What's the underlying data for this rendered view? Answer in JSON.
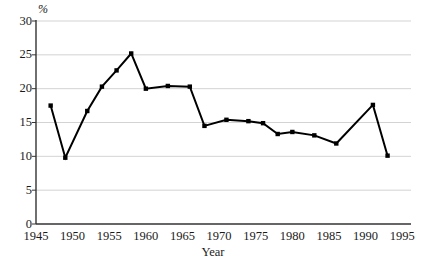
{
  "figure": {
    "y_axis_title": "%",
    "x_axis_title": "Year",
    "caption": ""
  },
  "chart_data": {
    "type": "line",
    "title": "",
    "xlabel": "Year",
    "ylabel": "%",
    "xlim": [
      1945,
      1996
    ],
    "ylim": [
      0,
      30
    ],
    "grid": true,
    "legend": "none",
    "marker": "square",
    "line_color": "#000000",
    "marker_color": "#000000",
    "grid_color": "#c8c8c8",
    "axis_color": "#333333",
    "xticks": [
      1945,
      1950,
      1955,
      1960,
      1965,
      1970,
      1975,
      1980,
      1985,
      1990,
      1995
    ],
    "yticks": [
      0,
      5,
      10,
      15,
      20,
      25,
      30
    ],
    "x": [
      1947,
      1949,
      1952,
      1954,
      1956,
      1958,
      1960,
      1963,
      1966,
      1968,
      1971,
      1974,
      1976,
      1978,
      1980,
      1983,
      1986,
      1991,
      1993
    ],
    "values": [
      17.5,
      9.8,
      16.7,
      20.3,
      22.7,
      25.2,
      20.0,
      20.4,
      20.3,
      14.5,
      15.4,
      15.2,
      14.9,
      13.3,
      13.6,
      13.1,
      11.9,
      17.6,
      10.1
    ]
  }
}
